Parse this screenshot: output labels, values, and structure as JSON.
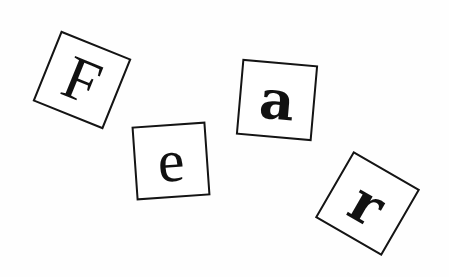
{
  "tiles": [
    {
      "letter": "F",
      "cx": 82,
      "cy": 80,
      "size": 76,
      "rotate": 22,
      "font_size": 62,
      "style": "serif",
      "weight": "normal"
    },
    {
      "letter": "e",
      "cx": 171,
      "cy": 161,
      "size": 74,
      "rotate": -4,
      "font_size": 60,
      "style": "serif",
      "weight": "normal"
    },
    {
      "letter": "a",
      "cx": 277,
      "cy": 100,
      "size": 76,
      "rotate": 5,
      "font_size": 54,
      "style": "slab",
      "weight": "normal"
    },
    {
      "letter": "r",
      "cx": 367,
      "cy": 203,
      "size": 77,
      "rotate": 30,
      "font_size": 56,
      "style": "slab",
      "weight": "bold"
    }
  ],
  "colors": {
    "background": "#ffffff",
    "ink": "#111111"
  }
}
